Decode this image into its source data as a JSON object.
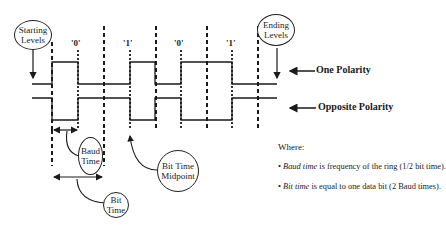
{
  "diagram": {
    "callouts": {
      "starting_levels": "Starting Levels",
      "ending_levels": "Ending Levels",
      "baud_time": "Baud Time",
      "bit_time": "Bit Time",
      "bit_time_midpoint": "Bit Time Midpoint"
    },
    "polarity_labels": {
      "one": "One Polarity",
      "opposite": "Opposite Polarity"
    },
    "bits": [
      "'0'",
      "'1'",
      "'0'",
      "'1'"
    ],
    "where": {
      "heading": "Where:",
      "notes": [
        {
          "term": "Baud time",
          "text": " is frequency of the ring (1/2 bit time)."
        },
        {
          "term": "Bit time",
          "text": " is equal to one data bit (2 Baud times)."
        }
      ]
    },
    "colors": {
      "line": "#1a1a1a",
      "background": "#ffffff"
    }
  }
}
